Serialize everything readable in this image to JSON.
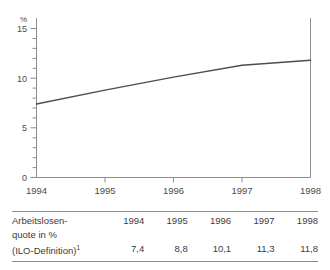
{
  "chart_data": {
    "type": "line",
    "title": "",
    "xlabel": "",
    "ylabel": "%",
    "categories": [
      "1994",
      "1995",
      "1996",
      "1997",
      "1998"
    ],
    "x": [
      1994,
      1995,
      1996,
      1997,
      1998
    ],
    "values": [
      7.4,
      8.8,
      10.1,
      11.3,
      11.8
    ],
    "series": [
      {
        "name": "Arbeitslosenquote in % (ILO-Definition)",
        "values": [
          7.4,
          8.8,
          10.1,
          11.3,
          11.8
        ]
      }
    ],
    "ylim": [
      0,
      15
    ],
    "xlim": [
      1994,
      1998
    ],
    "yticks": [
      0,
      5,
      10,
      15
    ],
    "ytick_labels": [
      "0",
      "5",
      "10",
      "15"
    ],
    "yminor_step": 1,
    "xticks": [
      1994,
      1995,
      1996,
      1997,
      1998
    ],
    "xtick_labels": [
      "1994",
      "1995",
      "1996",
      "1997",
      "1998"
    ],
    "grid": false,
    "legend": "none",
    "line_color": "#4d4d4d",
    "axis_color": "#8d8d8d"
  },
  "axis": {
    "y_unit_label": "%",
    "y_labels": [
      "15",
      "10",
      "5",
      "0"
    ],
    "x_labels": [
      "1994",
      "1995",
      "1996",
      "1997",
      "1998"
    ]
  },
  "table": {
    "row_label_lines": [
      "Arbeitslosen-",
      "quote in %",
      "(ILO-Definition)"
    ],
    "row_label_superscript": "1",
    "years": [
      "1994",
      "1995",
      "1996",
      "1997",
      "1998"
    ],
    "values": [
      "7,4",
      "8,8",
      "10,1",
      "11,3",
      "11,8"
    ]
  },
  "colors": {
    "line": "#4d4d4d",
    "axis": "#8d8d8d",
    "rule": "#8d8d8d",
    "text": "#3b3b3b",
    "background": "#ffffff"
  }
}
